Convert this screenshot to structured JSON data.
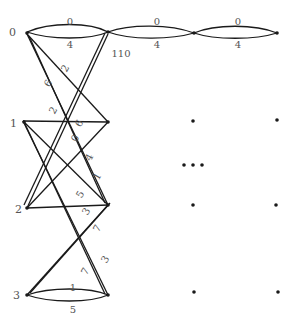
{
  "diagram": {
    "type": "layered-graph",
    "node_labels": [
      {
        "id": "n0",
        "label": "0",
        "x": 9,
        "y": 36
      },
      {
        "id": "n1",
        "label": "1",
        "x": 9,
        "y": 127
      },
      {
        "id": "n2",
        "label": "2",
        "x": 15,
        "y": 213
      },
      {
        "id": "n3",
        "label": "3",
        "x": 13,
        "y": 299
      }
    ],
    "top_loops": [
      {
        "id": "loop1",
        "top_label": "0",
        "bottom_label": "4"
      },
      {
        "id": "loop2",
        "top_label": "0",
        "bottom_label": "4"
      },
      {
        "id": "loop3",
        "top_label": "0",
        "bottom_label": "4"
      }
    ],
    "bottom_loop": {
      "top_label": "1",
      "bottom_label": "5"
    },
    "node_annotation": "110",
    "edge_labels": [
      {
        "text": "2",
        "x": 68,
        "y": 70,
        "rotate": -60
      },
      {
        "text": "6",
        "x": 51,
        "y": 85,
        "rotate": -60
      },
      {
        "text": "2",
        "x": 56,
        "y": 112,
        "rotate": -60
      },
      {
        "text": "6",
        "x": 82,
        "y": 125,
        "rotate": -60
      },
      {
        "text": "0",
        "x": 78,
        "y": 140,
        "rotate": -60
      },
      {
        "text": "4",
        "x": 92,
        "y": 159,
        "rotate": -60
      },
      {
        "text": "1",
        "x": 100,
        "y": 178,
        "rotate": -60
      },
      {
        "text": "5",
        "x": 83,
        "y": 196,
        "rotate": -60
      },
      {
        "text": "3",
        "x": 89,
        "y": 213,
        "rotate": -60
      },
      {
        "text": "7",
        "x": 100,
        "y": 230,
        "rotate": -60
      },
      {
        "text": "3",
        "x": 108,
        "y": 261,
        "rotate": -60
      },
      {
        "text": "7",
        "x": 88,
        "y": 273,
        "rotate": -60
      }
    ],
    "ellipsis": "• • •"
  }
}
